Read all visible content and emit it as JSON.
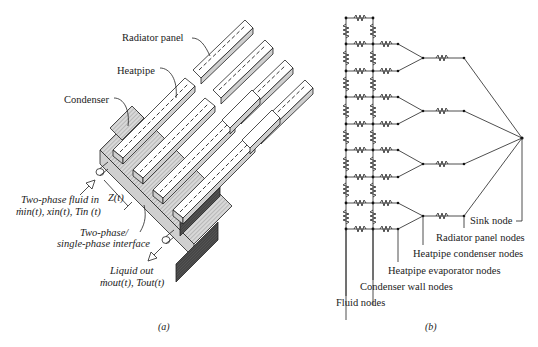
{
  "figure": {
    "panel_a": {
      "caption": "(a)",
      "labels": {
        "radiator_panel": "Radiator panel",
        "heatpipe": "Heatpipe",
        "condenser": "Condenser",
        "inlet_line1": "Two-phase fluid in",
        "inlet_line2": "ṁin(t),  xin(t),  Tin (t)",
        "z": "Z(t)",
        "interface_line1": "Two-phase/",
        "interface_line2": "single-phase interface",
        "outlet_line1": "Liquid out",
        "outlet_line2": "ṁout(t),  Tout(t)"
      }
    },
    "panel_b": {
      "caption": "(b)",
      "labels": {
        "sink_node": "Sink node",
        "radiator_panel_nodes": "Radiator panel nodes",
        "heatpipe_condenser_nodes": "Heatpipe condenser nodes",
        "heatpipe_evaporator_nodes": "Heatpipe evaporator nodes",
        "condenser_wall_nodes": "Condenser wall nodes",
        "fluid_nodes": "Fluid nodes"
      },
      "network": {
        "fluid_node_count": 9,
        "wall_node_count": 9,
        "heatpipes": 4,
        "radiator_panels": 4,
        "sink_nodes": 1
      }
    }
  }
}
